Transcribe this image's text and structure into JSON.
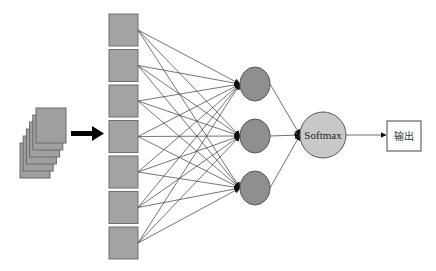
{
  "diagram": {
    "title": "",
    "input_stack": {
      "label": "",
      "page_count": 6,
      "icon": "document-stack-icon"
    },
    "transfer_arrow": {
      "icon": "thick-right-arrow-icon"
    },
    "input_layer": {
      "node_count": 7,
      "shape": "square"
    },
    "hidden_layer": {
      "node_count": 3,
      "shape": "circle"
    },
    "softmax_node": {
      "label": "Softmax"
    },
    "output_node": {
      "label": "输出"
    },
    "connections": "fully-connected input→hidden, hidden→softmax, softmax→output",
    "colors": {
      "input_square": "#a3a3a3",
      "hidden_node": "#8f8f8f",
      "softmax_node": "#c8c8c8",
      "edges": "#3a3a3a"
    }
  }
}
